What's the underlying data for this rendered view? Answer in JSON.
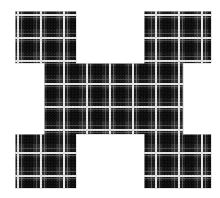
{
  "canvas": {
    "width": 220,
    "height": 198,
    "background_color": "#ffffff",
    "description": "Dark tartan plaid textile swatch cut into an I-beam / H-shaped silhouette on a white background"
  },
  "figure": {
    "name": "plaid-ibeam-shape",
    "shape_type": "i-beam",
    "bounds": {
      "x": 15,
      "y": 11,
      "width": 196,
      "height": 177
    },
    "arm_top_y": 11,
    "arm_top_bottom_y": 63,
    "arm_bottom_top_y": 134,
    "arm_bottom_y": 188,
    "center_left_x": 44,
    "center_right_x": 183,
    "outline_points": "15,11 76,11 76,63 15,63 15,11",
    "polygon": [
      [
        15,
        11
      ],
      [
        76,
        11
      ],
      [
        76,
        63
      ],
      [
        144,
        63
      ],
      [
        144,
        11
      ],
      [
        211,
        11
      ],
      [
        211,
        63
      ],
      [
        183,
        63
      ],
      [
        183,
        134
      ],
      [
        211,
        134
      ],
      [
        211,
        188
      ],
      [
        144,
        188
      ],
      [
        144,
        134
      ],
      [
        76,
        134
      ],
      [
        76,
        188
      ],
      [
        15,
        188
      ],
      [
        15,
        134
      ],
      [
        44,
        134
      ],
      [
        44,
        63
      ],
      [
        15,
        63
      ]
    ]
  },
  "pattern": {
    "name": "tartan-plaid",
    "base_color": "#3a3a3a",
    "mid_color": "#2e2e2e",
    "dark_band_color": "#121212",
    "darkest_color": "#080808",
    "highlight_line_color": "#f2f2f2",
    "thin_line_color": "#9a9a9a",
    "grid_period_px": 23,
    "highlight_line_width_px": 2,
    "dark_band_width_px": 9,
    "noise_opacity": 0.3,
    "vertical_highlight_lines": [
      17,
      40,
      63,
      86,
      109,
      132,
      155,
      178,
      201
    ],
    "horizontal_highlight_lines": [
      14,
      37,
      60,
      83,
      106,
      129,
      152,
      175
    ],
    "vertical_dark_bands": [
      26,
      49,
      72,
      95,
      118,
      141,
      164,
      187
    ],
    "horizontal_dark_bands": [
      22,
      45,
      68,
      91,
      114,
      137,
      160,
      183
    ]
  }
}
